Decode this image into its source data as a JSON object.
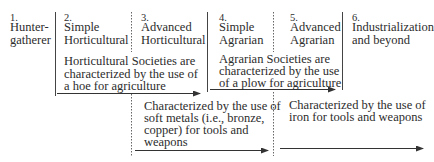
{
  "stages": [
    {
      "number": "1.",
      "lines": [
        "Hunter-",
        "gatherer"
      ]
    },
    {
      "number": "2.",
      "lines": [
        "Simple",
        "Horticultural"
      ]
    },
    {
      "number": "3.",
      "lines": [
        "Advanced",
        "Horticultural"
      ]
    },
    {
      "number": "4.",
      "lines": [
        "Simple",
        "Agrarian"
      ]
    },
    {
      "number": "5.",
      "lines": [
        "Advanced",
        "Agrarian"
      ]
    },
    {
      "number": "6.",
      "lines": [
        "Industrialization",
        "and beyond"
      ]
    }
  ],
  "descriptions": {
    "horticultural": [
      "Horticultural Societies are",
      "characterized by the use of",
      "a hoe for agriculture"
    ],
    "agrarian": [
      "Agrarian Societies are",
      "characterized by the use",
      "of a plow for agriculture"
    ],
    "soft_metals": [
      "Characterized by the use of",
      "soft metals (i.e., bronze,",
      "copper) for tools and",
      "weapons"
    ],
    "iron": [
      "Characterized by the use of",
      "iron for tools and weapons"
    ]
  },
  "colors": {
    "line": "#333333",
    "text": "#2c2c2c"
  }
}
